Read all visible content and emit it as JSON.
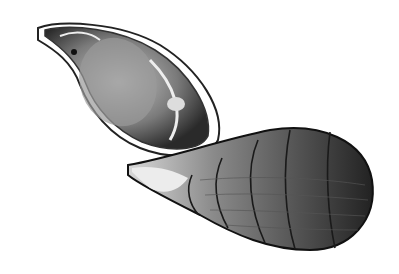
{
  "image": {
    "subject": "shell illustration",
    "width": 399,
    "height": 274,
    "background": "#ffffff",
    "elements": [
      {
        "name": "shell-aperture-view",
        "description": "teardrop shell seen from aperture side, upper left"
      },
      {
        "name": "shell-exterior-view",
        "description": "elongated ribbed shell seen from exterior, lower right"
      }
    ],
    "colors": {
      "ink": "#1a1a1a",
      "mid": "#6b6b6b",
      "light": "#cfcfcf"
    }
  }
}
